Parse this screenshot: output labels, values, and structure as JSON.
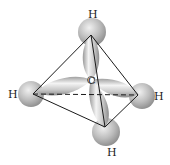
{
  "diagram": {
    "central_atom": {
      "label": "C"
    },
    "hydrogens": [
      {
        "id": "top",
        "label": "H"
      },
      {
        "id": "left",
        "label": "H"
      },
      {
        "id": "right",
        "label": "H"
      },
      {
        "id": "bottom",
        "label": "H"
      }
    ],
    "colors": {
      "orbital_light": "#f2f2f2",
      "orbital_dark": "#8a8a8a",
      "sphere_light": "#e6e6e6",
      "sphere_dark": "#8c8c8c",
      "edge": "#1a1a1a"
    }
  }
}
